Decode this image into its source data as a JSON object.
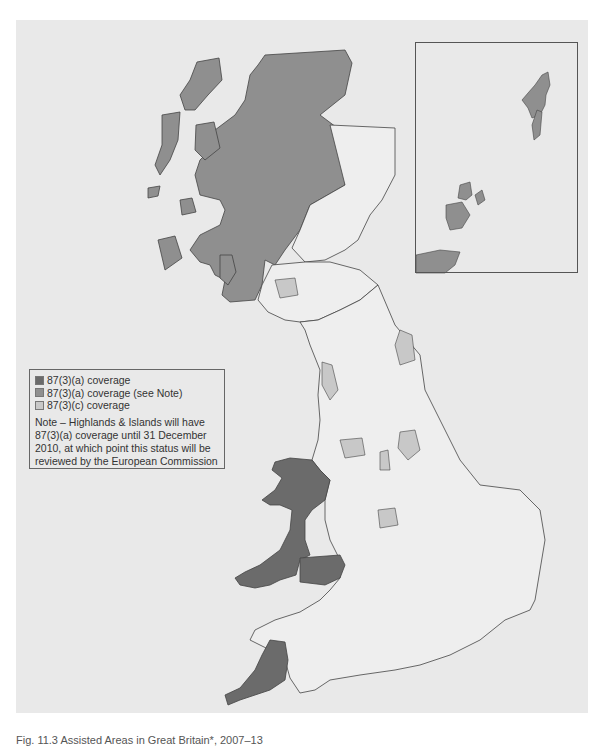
{
  "map": {
    "title": "Assisted Areas in Great Britain",
    "background_color": "#e9e9e9",
    "land_color": "#eeeeee",
    "boundary_color": "#444444"
  },
  "legend": {
    "items": [
      {
        "label": "87(3)(a) coverage",
        "color": "#6b6b6b"
      },
      {
        "label": "87(3)(a) coverage (see Note)",
        "color": "#8f8f8f"
      },
      {
        "label": "87(3)(c) coverage",
        "color": "#c8c8c8"
      }
    ],
    "note": "Note – Highlands & Islands will have 87(3)(a) coverage until 31 December 2010, at which point this status will be reviewed by the European Commission"
  },
  "caption": "Fig. 11.3 Assisted Areas in Great Britain*, 2007–13",
  "regions": {
    "87_3_a": [
      "Wales (west & valleys)",
      "Cornwall & Isles of Scilly"
    ],
    "87_3_a_see_note": [
      "Highlands & Islands",
      "Orkney",
      "Shetland"
    ],
    "87_3_c": [
      "Tees Valley / Durham",
      "West Cumbria",
      "South Yorkshire",
      "Greater Manchester & Merseyside parts",
      "West Midlands parts",
      "Lanarkshire / Glasgow",
      "Dundee",
      "Humberside parts"
    ]
  }
}
